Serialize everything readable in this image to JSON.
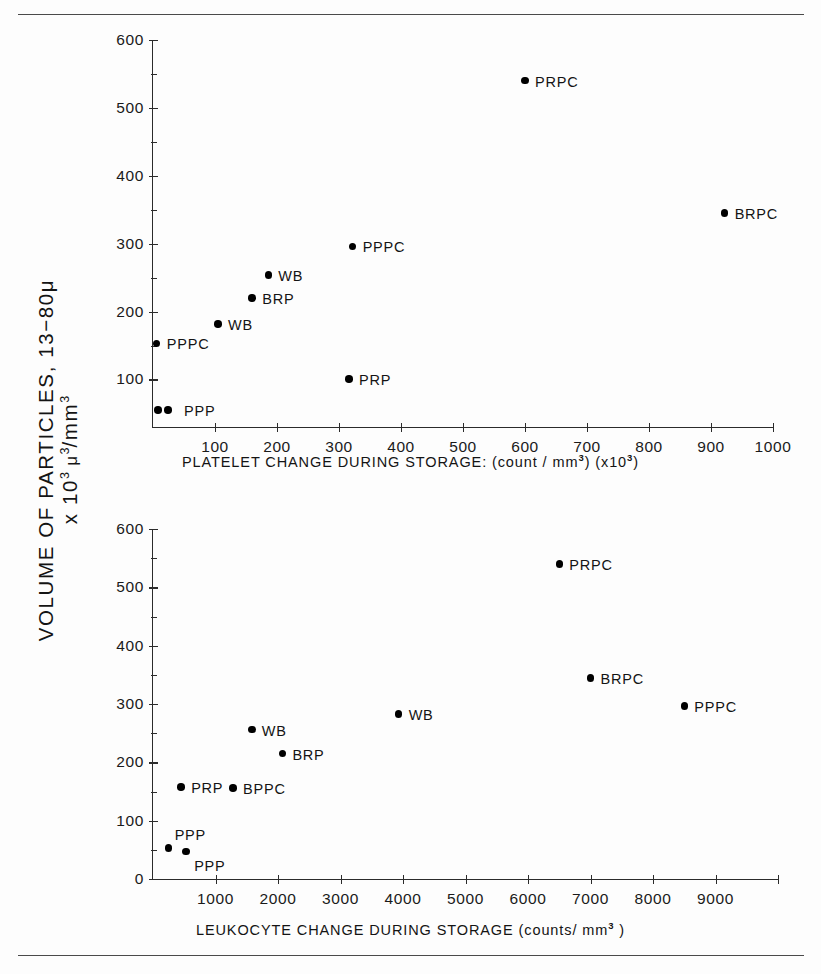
{
  "figure": {
    "y_axis_title_line1": "VOLUME OF PARTICLES, 13−80μ",
    "y_axis_title_line2_prefix": "x 10",
    "y_axis_title_line2_exp": "3",
    "y_axis_title_line2_mid": " μ",
    "y_axis_title_line2_exp2": "3",
    "y_axis_title_line2_unit": "/mm",
    "y_axis_title_line2_exp3": "3"
  },
  "chart_data": [
    {
      "type": "scatter",
      "title": "",
      "xlabel": "PLATELET CHANGE DURING STORAGE: (count / mm³) (x10³)",
      "xlabel_main": "PLATELET CHANGE DURING STORAGE: (count / mm",
      "xlabel_sup1": "3",
      "xlabel_mid": ") (x10",
      "xlabel_sup2": "3",
      "xlabel_end": ")",
      "ylabel": "VOLUME OF PARTICLES, 13-80μ x 10³ μ³/mm³",
      "xlim": [
        0,
        1000
      ],
      "ylim": [
        30,
        600
      ],
      "xticks": [
        100,
        200,
        300,
        400,
        500,
        600,
        700,
        800,
        900,
        1000
      ],
      "xticklabels": [
        "100",
        "200",
        "300",
        "400",
        "500",
        "600",
        "700",
        "800",
        "900",
        "1000"
      ],
      "yticks": [
        100,
        200,
        300,
        400,
        500,
        600
      ],
      "yticklabels": [
        "100",
        "200",
        "300",
        "400",
        "500",
        "600"
      ],
      "yminorticks": [
        150,
        250,
        350,
        450,
        550
      ],
      "grid": false,
      "legend": "none",
      "points": [
        {
          "label": "PPP",
          "x": 8,
          "y": 55,
          "label_pos": "right-far"
        },
        {
          "label": "",
          "x": 24,
          "y": 55,
          "label_pos": "none"
        },
        {
          "label": "PPPC",
          "x": 6,
          "y": 153,
          "label_pos": "right"
        },
        {
          "label": "WB",
          "x": 105,
          "y": 182,
          "label_pos": "right"
        },
        {
          "label": "BRP",
          "x": 160,
          "y": 220,
          "label_pos": "right"
        },
        {
          "label": "WB",
          "x": 186,
          "y": 254,
          "label_pos": "right"
        },
        {
          "label": "PRP",
          "x": 316,
          "y": 101,
          "label_pos": "right"
        },
        {
          "label": "PPPC",
          "x": 322,
          "y": 296,
          "label_pos": "right"
        },
        {
          "label": "PRPC",
          "x": 600,
          "y": 540,
          "label_pos": "right"
        },
        {
          "label": "BRPC",
          "x": 922,
          "y": 345,
          "label_pos": "right"
        }
      ]
    },
    {
      "type": "scatter",
      "title": "",
      "xlabel": "LEUKOCYTE CHANGE DURING STORAGE (counts / mm³)",
      "xlabel_main": "LEUKOCYTE CHANGE DURING STORAGE (counts/ mm",
      "xlabel_sup1": "3",
      "xlabel_mid": "",
      "xlabel_sup2": "",
      "xlabel_end": " )",
      "ylabel": "VOLUME OF PARTICLES, 13-80μ x 10³ μ³/mm³",
      "xlim": [
        0,
        10000
      ],
      "ylim": [
        0,
        600
      ],
      "xticks": [
        1000,
        2000,
        3000,
        4000,
        5000,
        6000,
        7000,
        8000,
        9000,
        10000
      ],
      "xticklabels": [
        "1000",
        "2000",
        "3000",
        "4000",
        "5000",
        "6000",
        "7000",
        "8000",
        "9000",
        ""
      ],
      "yticks": [
        0,
        100,
        200,
        300,
        400,
        500,
        600
      ],
      "yticklabels": [
        "0",
        "100",
        "200",
        "300",
        "400",
        "500",
        "600"
      ],
      "yminorticks": [
        50,
        150,
        250,
        350,
        450,
        550
      ],
      "grid": false,
      "legend": "none",
      "points": [
        {
          "label": "PPP",
          "x": 250,
          "y": 53,
          "label_pos": "above-right"
        },
        {
          "label": "PPP",
          "x": 530,
          "y": 47,
          "label_pos": "below-right"
        },
        {
          "label": "PRP",
          "x": 450,
          "y": 158,
          "label_pos": "right"
        },
        {
          "label": "BPPC",
          "x": 1280,
          "y": 156,
          "label_pos": "right"
        },
        {
          "label": "WB",
          "x": 1580,
          "y": 256,
          "label_pos": "right"
        },
        {
          "label": "BRP",
          "x": 2070,
          "y": 215,
          "label_pos": "right"
        },
        {
          "label": "WB",
          "x": 3930,
          "y": 283,
          "label_pos": "right"
        },
        {
          "label": "PRPC",
          "x": 6500,
          "y": 540,
          "label_pos": "right"
        },
        {
          "label": "BRPC",
          "x": 7000,
          "y": 345,
          "label_pos": "right"
        },
        {
          "label": "PPPC",
          "x": 8500,
          "y": 297,
          "label_pos": "right"
        }
      ]
    }
  ]
}
